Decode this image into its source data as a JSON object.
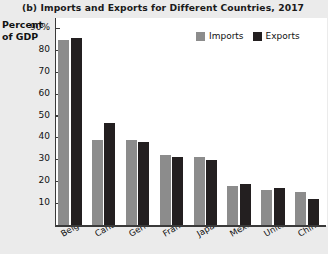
{
  "chart_data": {
    "type": "bar",
    "title": "(b) Imports and Exports for Different Countries, 2017",
    "xlabel": "",
    "ylabel": "Percent of GDP",
    "ylabel_lines": [
      "Percent",
      "of GDP"
    ],
    "ylim": [
      0,
      95
    ],
    "grid": false,
    "legend_position": "top-right",
    "yticks": [
      {
        "value": 90,
        "label": "90%"
      },
      {
        "value": 80,
        "label": "80"
      },
      {
        "value": 70,
        "label": "70"
      },
      {
        "value": 60,
        "label": "60"
      },
      {
        "value": 50,
        "label": "50"
      },
      {
        "value": 40,
        "label": "40"
      },
      {
        "value": 30,
        "label": "30"
      },
      {
        "value": 20,
        "label": "20"
      },
      {
        "value": 10,
        "label": "10"
      }
    ],
    "categories": [
      "Belgium",
      "Canada",
      "Germany",
      "France",
      "Japan",
      "Mexico",
      "United States",
      "China"
    ],
    "series": [
      {
        "name": "Imports",
        "color": "#8c8c8c",
        "values": [
          85,
          39,
          39,
          32,
          31,
          18,
          16,
          15
        ]
      },
      {
        "name": "Exports",
        "color": "#231f20",
        "values": [
          86,
          47,
          38,
          31,
          30,
          19,
          17,
          12
        ]
      }
    ]
  },
  "colors": {
    "page_background": "#ebebeb",
    "plot_background": "#ffffff",
    "axis": "#3a3a3a",
    "imports": "#8c8c8c",
    "exports": "#231f20",
    "text": "#111111"
  }
}
